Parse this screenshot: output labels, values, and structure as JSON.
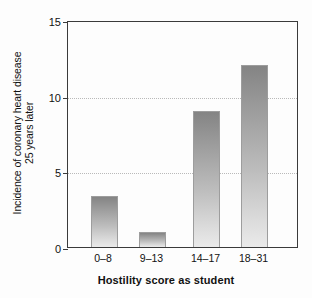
{
  "chart_data": {
    "type": "bar",
    "title": "",
    "xlabel": "Hostility score as student",
    "ylabel_line1": "Incidence of coronary heart disease",
    "ylabel_line2": "25 years later",
    "categories": [
      "0–8",
      "9–13",
      "14–17",
      "18–31"
    ],
    "values": [
      3.4,
      1.0,
      9.0,
      12.0
    ],
    "ylim": [
      0,
      15
    ],
    "yticks": [
      0,
      5,
      10,
      15
    ],
    "ytick_labels": [
      "0",
      "5",
      "10",
      "15"
    ],
    "gridlines_at": [
      5,
      10
    ],
    "grid": "horizontal-dotted",
    "legend": "none",
    "bar_fill_top_color": "#848484",
    "bar_fill_bottom_color": "#eaeaea",
    "axis_color": "#3b3b3b",
    "grid_color": "#b9b9b9",
    "background_color": "#fdfdfd"
  }
}
